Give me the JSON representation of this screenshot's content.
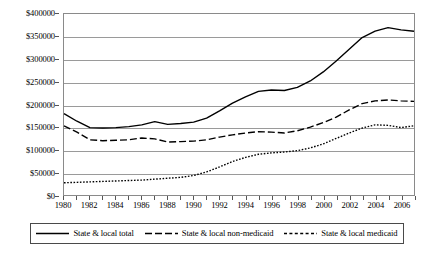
{
  "chart_data": {
    "type": "line",
    "title": "",
    "subtitle": "",
    "xlabel": "",
    "ylabel": "",
    "grid": true,
    "legend_position": "bottom",
    "xlim": [
      1980,
      2007
    ],
    "ylim": [
      0,
      400000
    ],
    "x": [
      1980,
      1981,
      1982,
      1983,
      1984,
      1985,
      1986,
      1987,
      1988,
      1989,
      1990,
      1991,
      1992,
      1993,
      1994,
      1995,
      1996,
      1997,
      1998,
      1999,
      2000,
      2001,
      2002,
      2003,
      2004,
      2005,
      2006,
      2007
    ],
    "x_tick_labels": [
      "1980",
      "1982",
      "1984",
      "1986",
      "1988",
      "1990",
      "1992",
      "1994",
      "1996",
      "1998",
      "2000",
      "2002",
      "2004",
      "2006"
    ],
    "y_tick_values": [
      0,
      50000,
      100000,
      150000,
      200000,
      250000,
      300000,
      350000,
      400000
    ],
    "y_tick_labels": [
      "$0",
      "$50000",
      "$100000",
      "$150000",
      "$200000",
      "$250000",
      "$300000",
      "$350000",
      "$400000"
    ],
    "series": [
      {
        "name": "State & local total",
        "style": "solid",
        "color": "#000000",
        "values": [
          180000,
          163000,
          149000,
          148000,
          149000,
          151000,
          155000,
          162000,
          156000,
          158000,
          161000,
          170000,
          186000,
          203000,
          217000,
          229000,
          232000,
          231000,
          238000,
          252000,
          272000,
          296000,
          322000,
          348000,
          362000,
          370000,
          365000,
          362000
        ]
      },
      {
        "name": "State & local non-medicaid",
        "style": "dashed",
        "color": "#000000",
        "values": [
          153000,
          139000,
          122000,
          120000,
          121000,
          122000,
          126000,
          124000,
          117000,
          118000,
          119000,
          122000,
          128000,
          133000,
          137000,
          140000,
          139000,
          137000,
          142000,
          150000,
          160000,
          172000,
          188000,
          202000,
          208000,
          210000,
          208000,
          207000
        ]
      },
      {
        "name": "State & local medicaid",
        "style": "dotted",
        "color": "#000000",
        "values": [
          27000,
          28000,
          29000,
          30000,
          31000,
          32000,
          33000,
          35000,
          37000,
          39000,
          43000,
          51000,
          62000,
          74000,
          83000,
          90000,
          93000,
          95000,
          98000,
          104000,
          113000,
          125000,
          137000,
          148000,
          155000,
          154000,
          149000,
          153000
        ]
      }
    ]
  },
  "legend": {
    "entries": [
      {
        "label": "State & local total",
        "swatch": "solid-line-swatch"
      },
      {
        "label": "State & local non-medicaid",
        "swatch": "dashed-line-swatch"
      },
      {
        "label": "State & local medicaid",
        "swatch": "dotted-line-swatch"
      }
    ]
  }
}
